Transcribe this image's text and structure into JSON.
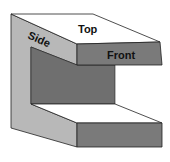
{
  "diagram": {
    "type": "isometric-c-shape-block",
    "labels": {
      "top": "Top",
      "side": "Side",
      "front": "Front"
    },
    "colors": {
      "background": "#ffffff",
      "top_face": "#ffffff",
      "side_face": "#b8b8b8",
      "front_face": "#7a7a7a",
      "inner_wall": "#6f6f6f",
      "outline": "#222222"
    }
  }
}
